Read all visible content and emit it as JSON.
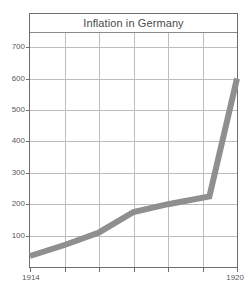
{
  "chart_data": {
    "type": "line",
    "title": "Inflation in Germany",
    "xlabel": "",
    "ylabel": "",
    "x": [
      1914,
      1915,
      1916,
      1917,
      1918,
      1919.2,
      1920
    ],
    "values": [
      35,
      70,
      110,
      175,
      200,
      225,
      600
    ],
    "series": [
      {
        "name": "Inflation index",
        "values": [
          35,
          70,
          110,
          175,
          200,
          225,
          600
        ],
        "color": "#8f8f8f"
      }
    ],
    "xlim": [
      1914,
      1920
    ],
    "ylim": [
      0,
      745
    ],
    "yticks": [
      100,
      200,
      300,
      400,
      500,
      600,
      700
    ],
    "ytick_labels": [
      "100",
      "200",
      "300",
      "400",
      "500",
      "600",
      "700"
    ],
    "xticks": [
      1914,
      1915,
      1916,
      1917,
      1918,
      1919,
      1920
    ],
    "xtick_labels_shown": [
      "1914",
      "1920"
    ],
    "grid": true,
    "legend": "none",
    "annotations": []
  },
  "axes": {
    "x_first_label": "1914",
    "x_last_label": "1920"
  },
  "colors": {
    "line": "#8f8f8f",
    "grid": "#bdbdbd",
    "frame": "#6e6e6e",
    "text": "#5a5a5a",
    "title_text": "#4a4a4a",
    "background": "#ffffff"
  }
}
